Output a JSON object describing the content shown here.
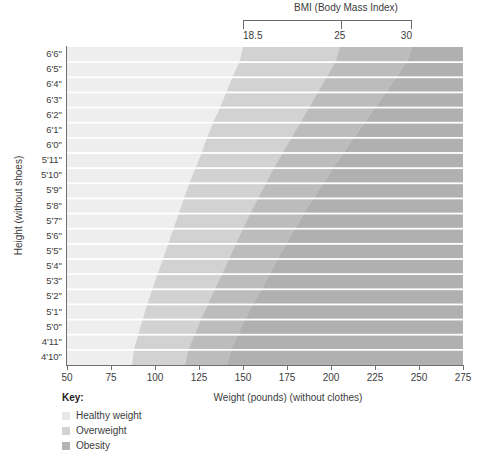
{
  "header": {
    "bmi_title": "BMI (Body Mass Index)",
    "bmi_ticks": [
      {
        "label": "18.5",
        "bmi": 18.5
      },
      {
        "label": "25",
        "bmi": 25
      },
      {
        "label": "30",
        "bmi": 30
      }
    ]
  },
  "legend": {
    "title": "Key:",
    "items": [
      {
        "label": "Healthy weight",
        "color": "#e8e8e8"
      },
      {
        "label": "Overweight",
        "color": "#d2d2d2"
      },
      {
        "label": "Obesity",
        "color": "#b4b4b4"
      }
    ]
  },
  "chart_data": {
    "type": "heatmap",
    "title": "BMI (Body Mass Index)",
    "xlabel": "Weight (pounds) (without clothes)",
    "ylabel": "Height (without shoes)",
    "xlim": [
      50,
      275
    ],
    "ylim_labels": [
      "4'10\"",
      "6'6\""
    ],
    "grid": true,
    "legend_position": "bottom-left",
    "x_ticks": [
      50,
      75,
      100,
      125,
      150,
      175,
      200,
      225,
      250,
      275
    ],
    "x_tick_labels": [
      "50",
      "75",
      "100",
      "125",
      "150",
      "175",
      "200",
      "225",
      "250",
      "275"
    ],
    "y_categories": [
      "6'6\"",
      "6'5\"",
      "6'4\"",
      "6'3\"",
      "6'2\"",
      "6'1\"",
      "6'0\"",
      "5'11\"",
      "5'10\"",
      "5'9\"",
      "5'8\"",
      "5'7\"",
      "5'6\"",
      "5'5\"",
      "5'4\"",
      "5'3\"",
      "5'2\"",
      "5'1\"",
      "5'0\"",
      "4'11\"",
      "4'10\""
    ],
    "y_heights_inches": [
      78,
      77,
      76,
      75,
      74,
      73,
      72,
      71,
      70,
      69,
      68,
      67,
      66,
      65,
      64,
      63,
      62,
      61,
      60,
      59,
      58
    ],
    "bands": [
      {
        "name": "Healthy weight",
        "bmi_range": [
          0,
          18.5
        ],
        "color": "#eeeeee"
      },
      {
        "name": "Overweight",
        "bmi_range": [
          18.5,
          25
        ],
        "color": "#d2d2d2"
      },
      {
        "name": "Obesity",
        "bmi_range": [
          25,
          30
        ],
        "color": "#bcbcbc"
      },
      {
        "name": "Obesity",
        "bmi_range": [
          30,
          99
        ],
        "color": "#b0b0b0"
      }
    ],
    "boundary_weights_lb": {
      "bmi_18_5": [
        150,
        146,
        142,
        139,
        135,
        131,
        128,
        125,
        121,
        118,
        115,
        112,
        109,
        106,
        103,
        100,
        97,
        94,
        92,
        89,
        87
      ],
      "bmi_25": [
        205,
        200,
        195,
        190,
        185,
        180,
        175,
        170,
        165,
        161,
        156,
        152,
        148,
        144,
        140,
        136,
        132,
        128,
        124,
        121,
        117
      ],
      "bmi_30": [
        246,
        240,
        234,
        228,
        222,
        216,
        210,
        204,
        198,
        193,
        187,
        182,
        177,
        172,
        167,
        163,
        158,
        153,
        149,
        145,
        141
      ]
    }
  }
}
